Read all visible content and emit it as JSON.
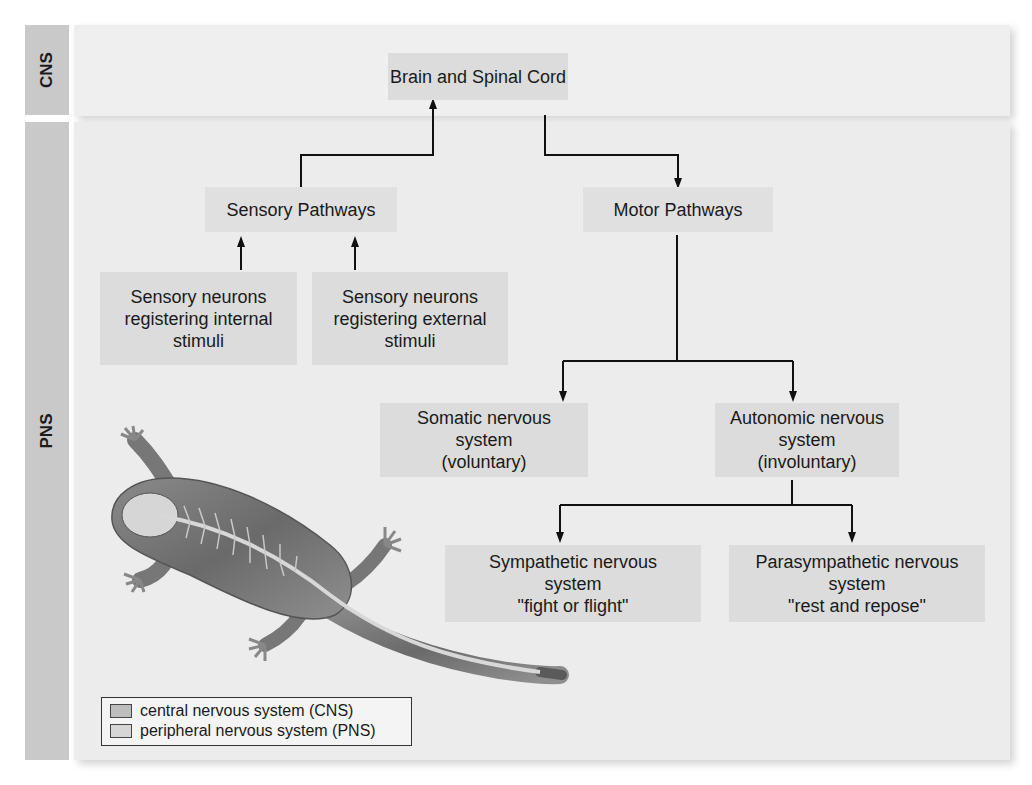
{
  "side_labels": {
    "cns": "CNS",
    "pns": "PNS"
  },
  "nodes": {
    "brain": "Brain and Spinal Cord",
    "sensory_pathways": "Sensory Pathways",
    "motor_pathways": "Motor Pathways",
    "sensory_internal": "Sensory neurons\nregistering internal\nstimuli",
    "sensory_external": "Sensory neurons\nregistering external\nstimuli",
    "somatic": "Somatic nervous\nsystem\n(voluntary)",
    "autonomic": "Autonomic nervous\nsystem\n(involuntary)",
    "sympathetic": "Sympathetic nervous\nsystem\n\"fight or flight\"",
    "parasympathetic": "Parasympathetic nervous\nsystem\n\"rest and repose\""
  },
  "legend": {
    "items": [
      {
        "label": "central nervous system (CNS)",
        "color": "#bdbdbd"
      },
      {
        "label": "peripheral nervous system (PNS)",
        "color": "#d6d6d6"
      }
    ]
  },
  "illustration": {
    "subject": "lizard-nervous-system-illustration"
  },
  "colors": {
    "side_label_bg": "#c9c9c9",
    "panel_bg": "#ececec",
    "box_bg": "#dcdcdc",
    "arrow": "#111111"
  }
}
